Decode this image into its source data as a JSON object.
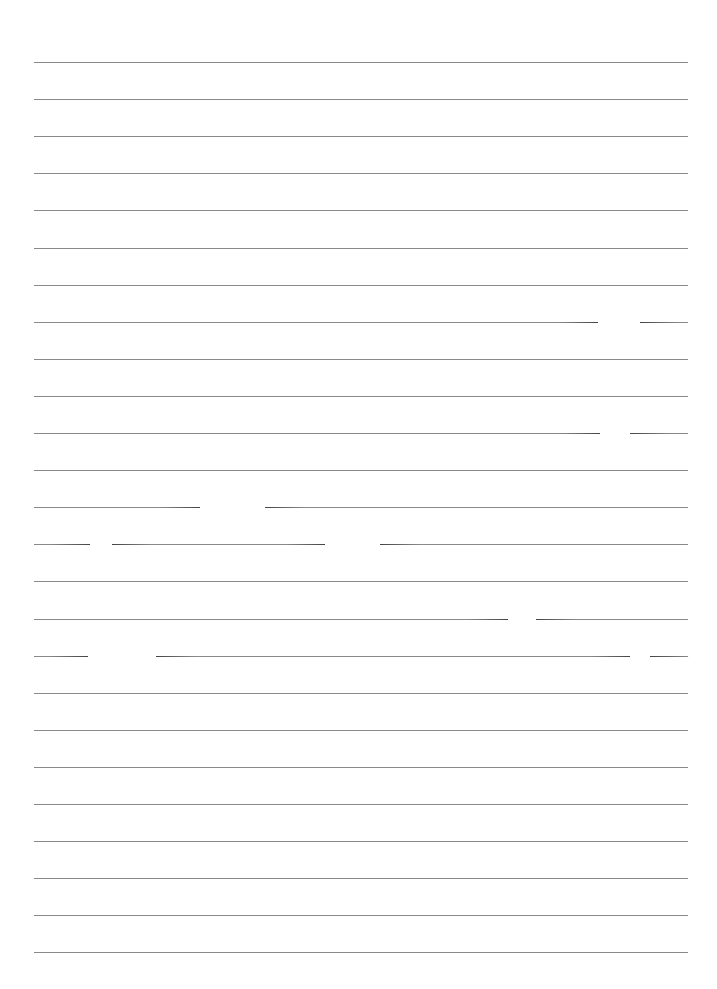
{
  "page": {
    "type": "lined-paper",
    "background_color": "#ffffff",
    "rule_color": "#8a8a8a",
    "rule_count": 25,
    "rule_left": 34,
    "rule_width": 654,
    "first_rule_y": 62,
    "rule_spacing": 37.1,
    "text": ""
  },
  "gaps": [
    {
      "rule": 7,
      "x": 598,
      "w": 42
    },
    {
      "rule": 10,
      "x": 600,
      "w": 30
    },
    {
      "rule": 12,
      "x": 200,
      "w": 65
    },
    {
      "rule": 13,
      "x": 90,
      "w": 22
    },
    {
      "rule": 13,
      "x": 325,
      "w": 55
    },
    {
      "rule": 15,
      "x": 508,
      "w": 28
    },
    {
      "rule": 16,
      "x": 88,
      "w": 68
    },
    {
      "rule": 16,
      "x": 630,
      "w": 20
    }
  ]
}
